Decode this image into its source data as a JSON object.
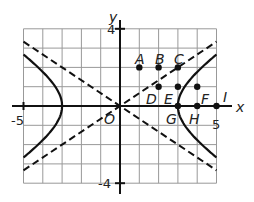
{
  "figure": {
    "axes": {
      "x_label": "x",
      "y_label": "y",
      "origin_label": "O",
      "x_ticks": [
        {
          "value": -5,
          "label": "-5"
        },
        {
          "value": 5,
          "label": "5"
        }
      ],
      "y_ticks": [
        {
          "value": 4,
          "label": "4"
        },
        {
          "value": -4,
          "label": "-4"
        }
      ],
      "x_range": [
        -5,
        5
      ],
      "y_range": [
        -4,
        4
      ],
      "grid": true
    },
    "hyperbola": {
      "a": 3,
      "b": 2,
      "style": "solid"
    },
    "asymptotes": [
      {
        "slope": 0.6667,
        "style": "dashed"
      },
      {
        "slope": -0.6667,
        "style": "dashed"
      }
    ],
    "points": [
      {
        "name": "A",
        "x": 1,
        "y": 2
      },
      {
        "name": "B",
        "x": 2,
        "y": 2
      },
      {
        "name": "C",
        "x": 3,
        "y": 2
      },
      {
        "name": "D",
        "x": 2,
        "y": 1
      },
      {
        "name": "E",
        "x": 3,
        "y": 1
      },
      {
        "name": "F",
        "x": 4,
        "y": 1
      },
      {
        "name": "G",
        "x": 3,
        "y": 0
      },
      {
        "name": "H",
        "x": 4,
        "y": 0
      },
      {
        "name": "I",
        "x": 5,
        "y": 0
      }
    ],
    "colors": {
      "line": "#111111",
      "grid": "#999999",
      "background": "#ffffff"
    }
  }
}
